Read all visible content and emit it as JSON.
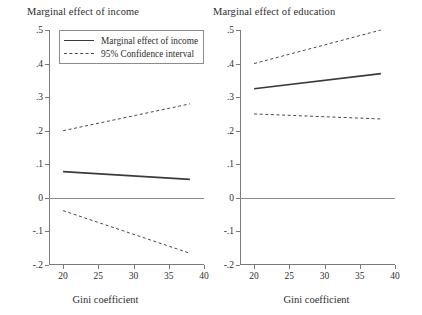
{
  "figure": {
    "background": "#ffffff",
    "solid_color": "#3a3a3a",
    "dashed_color": "#4a4a4a",
    "axis_color": "#7b7b7b"
  },
  "chart_data": [
    {
      "type": "line",
      "title": "Marginal effect of income",
      "xlabel": "Gini coefficient",
      "ylabel": "",
      "xlim": [
        18,
        40
      ],
      "ylim": [
        -0.2,
        0.5
      ],
      "xticks": [
        20,
        25,
        30,
        35,
        40
      ],
      "xticklabels": [
        "20",
        "25",
        "30",
        "35",
        "40"
      ],
      "yticks": [
        -0.2,
        -0.1,
        0,
        0.1,
        0.2,
        0.3,
        0.4,
        0.5
      ],
      "yticklabels": [
        "-.2",
        "-.1",
        "0",
        ".1",
        ".2",
        ".3",
        ".4",
        ".5"
      ],
      "grid": false,
      "zero_reference_line": 0,
      "x": [
        20,
        38
      ],
      "series": [
        {
          "name": "Marginal effect of income",
          "style": "solid",
          "values": [
            0.078,
            0.055
          ]
        },
        {
          "name": "95% Confidence interval upper",
          "style": "dashed",
          "values": [
            0.2,
            0.28
          ]
        },
        {
          "name": "95% Confidence interval lower",
          "style": "dashed",
          "values": [
            -0.038,
            -0.165
          ]
        }
      ],
      "legend": {
        "position": "top-left-inside",
        "entries": [
          {
            "label": "Marginal effect of income",
            "style": "solid"
          },
          {
            "label": "95% Confidence interval",
            "style": "dashed"
          }
        ]
      }
    },
    {
      "type": "line",
      "title": "Marginal effect of education",
      "xlabel": "Gini coefficient",
      "ylabel": "",
      "xlim": [
        18,
        40
      ],
      "ylim": [
        -0.2,
        0.5
      ],
      "xticks": [
        20,
        25,
        30,
        35,
        40
      ],
      "xticklabels": [
        "20",
        "25",
        "30",
        "35",
        "40"
      ],
      "yticks": [
        -0.2,
        -0.1,
        0,
        0.1,
        0.2,
        0.3,
        0.4,
        0.5
      ],
      "yticklabels": [
        "-.2",
        "-.1",
        "0",
        ".1",
        ".2",
        ".3",
        ".4",
        ".5"
      ],
      "grid": false,
      "zero_reference_line": 0,
      "x": [
        20,
        38
      ],
      "series": [
        {
          "name": "Marginal effect of education",
          "style": "solid",
          "values": [
            0.325,
            0.37
          ]
        },
        {
          "name": "95% Confidence interval upper",
          "style": "dashed",
          "values": [
            0.4,
            0.5
          ]
        },
        {
          "name": "95% Confidence interval lower",
          "style": "dashed",
          "values": [
            0.25,
            0.235
          ]
        }
      ],
      "legend": null
    }
  ]
}
